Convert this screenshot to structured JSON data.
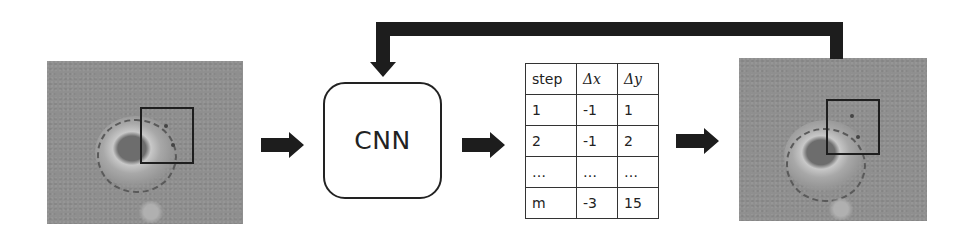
{
  "diagram": {
    "input_image": {
      "label": "input microscopy frame with region of interest"
    },
    "model": {
      "label": "CNN"
    },
    "table": {
      "headers": [
        "step",
        "Δx",
        "Δy"
      ],
      "rows": [
        [
          "1",
          "-1",
          "1"
        ],
        [
          "2",
          "-1",
          "2"
        ],
        [
          "…",
          "…",
          "…"
        ],
        [
          "m",
          "-3",
          "15"
        ]
      ]
    },
    "output_image": {
      "label": "output microscopy frame with shifted region of interest"
    },
    "feedback": {
      "label": "feedback loop from output image back to CNN"
    },
    "colors": {
      "arrow": "#1d1d1d",
      "image_bg": "#8f8f8f",
      "box_border": "#222222"
    }
  }
}
